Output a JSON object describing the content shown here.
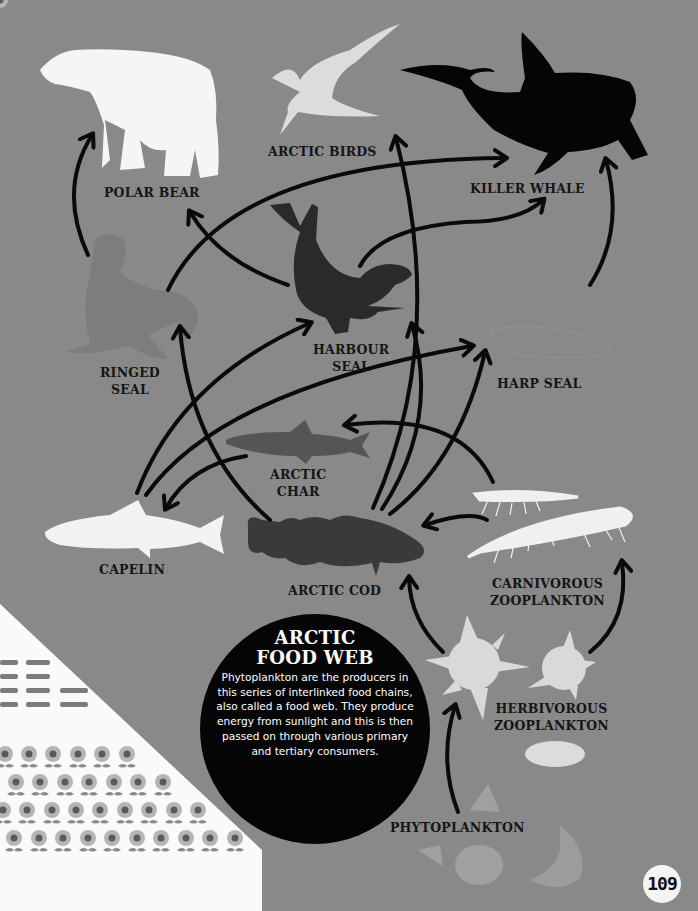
{
  "title": "ARCTIC FOOD WEB",
  "title_lines": [
    "ARCTIC",
    "FOOD WEB"
  ],
  "description": "Phytoplankton are the producers in this series of interlinked food chains, also called a food web. They produce energy from sunlight and this is then passed on through various primary and tertiary consumers.",
  "page_number": "109",
  "colors": {
    "background": "#898989",
    "arrow": "#0a0a0a",
    "light_silhouette": "#ebebeb",
    "mid_silhouette": "#7a7a7a",
    "dark_silhouette": "#2e2e2e",
    "black_silhouette": "#050505",
    "info_circle": "#050505"
  },
  "organisms": [
    {
      "id": "polar-bear",
      "label": "POLAR BEAR"
    },
    {
      "id": "arctic-birds",
      "label": "ARCTIC BIRDS"
    },
    {
      "id": "killer-whale",
      "label": "KILLER WHALE"
    },
    {
      "id": "ringed-seal",
      "label_lines": [
        "RINGED",
        "SEAL"
      ]
    },
    {
      "id": "harbour-seal",
      "label_lines": [
        "HARBOUR",
        "SEAL"
      ]
    },
    {
      "id": "harp-seal",
      "label": "HARP SEAL"
    },
    {
      "id": "arctic-char",
      "label_lines": [
        "ARCTIC",
        "CHAR"
      ]
    },
    {
      "id": "capelin",
      "label": "CAPELIN"
    },
    {
      "id": "arctic-cod",
      "label": "ARCTIC COD"
    },
    {
      "id": "carnivorous-zooplankton",
      "label_lines": [
        "CARNIVOROUS",
        "ZOOPLANKTON"
      ]
    },
    {
      "id": "herbivorous-zooplankton",
      "label_lines": [
        "HERBIVOROUS",
        "ZOOPLANKTON"
      ]
    },
    {
      "id": "phytoplankton",
      "label": "PHYTOPLANKTON"
    }
  ],
  "links": [
    {
      "from": "ringed-seal",
      "to": "polar-bear"
    },
    {
      "from": "harbour-seal",
      "to": "polar-bear"
    },
    {
      "from": "ringed-seal",
      "to": "killer-whale"
    },
    {
      "from": "harbour-seal",
      "to": "killer-whale"
    },
    {
      "from": "harp-seal",
      "to": "killer-whale"
    },
    {
      "from": "arctic-cod",
      "to": "arctic-birds"
    },
    {
      "from": "arctic-cod",
      "to": "ringed-seal"
    },
    {
      "from": "capelin",
      "to": "harbour-seal"
    },
    {
      "from": "capelin",
      "to": "harp-seal"
    },
    {
      "from": "arctic-cod",
      "to": "harbour-seal"
    },
    {
      "from": "arctic-cod",
      "to": "harp-seal"
    },
    {
      "from": "arctic-char",
      "to": "capelin"
    },
    {
      "from": "carnivorous-zooplankton",
      "to": "arctic-char"
    },
    {
      "from": "carnivorous-zooplankton",
      "to": "arctic-cod"
    },
    {
      "from": "herbivorous-zooplankton",
      "to": "arctic-cod"
    },
    {
      "from": "herbivorous-zooplankton",
      "to": "carnivorous-zooplankton"
    },
    {
      "from": "phytoplankton",
      "to": "herbivorous-zooplankton"
    }
  ]
}
